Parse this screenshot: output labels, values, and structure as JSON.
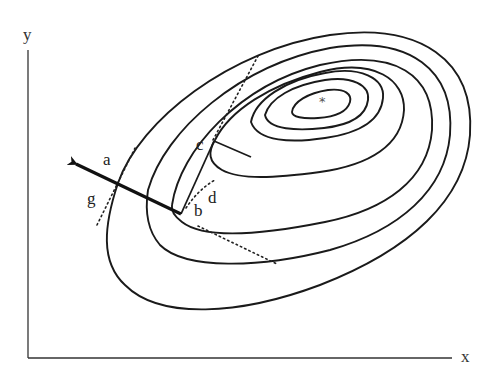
{
  "figure": {
    "type": "contour-plot-gradient-diagram",
    "axes": {
      "x_label": "x",
      "y_label": "y"
    },
    "optimum_marker": "*",
    "point_labels": {
      "a": "a",
      "b": "b",
      "c": "c",
      "d": "d",
      "g": "g"
    },
    "contour_count": 7,
    "colors": {
      "stroke": "#1a1a1a",
      "background": "#ffffff"
    },
    "elements": {
      "arrow": "gradient direction arrow from b through a",
      "tangent_lines": [
        "tangent at a/g",
        "tangent at b",
        "tangent at c",
        "curve d"
      ],
      "search_path": [
        "b",
        "c"
      ]
    }
  }
}
